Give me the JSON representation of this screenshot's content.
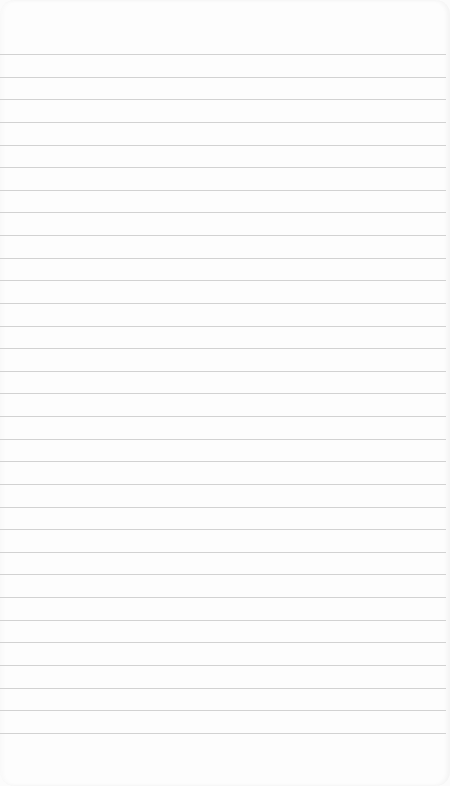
{
  "notepad": {
    "description": "Blank lined notepad page",
    "line_count": 31,
    "first_line_y": 54,
    "line_spacing": 22.63,
    "line_color": "#d2d2d2",
    "paper_color": "#fdfdfd",
    "lines": []
  }
}
